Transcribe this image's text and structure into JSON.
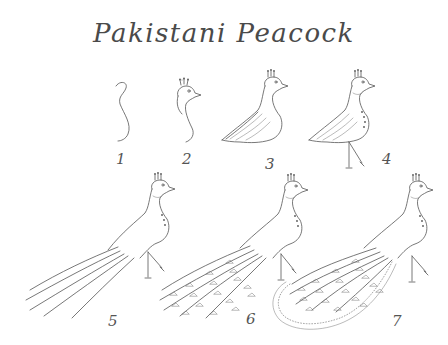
{
  "title": "Pakistani Peacock",
  "steps": [
    {
      "number": "1",
      "description": "Neck curve"
    },
    {
      "number": "2",
      "description": "Head with crest and beak"
    },
    {
      "number": "3",
      "description": "Body and folded wing"
    },
    {
      "number": "4",
      "description": "Legs and neck markings"
    },
    {
      "number": "5",
      "description": "Long train feathers"
    },
    {
      "number": "6",
      "description": "Eye spots on train"
    },
    {
      "number": "7",
      "description": "Fringed train outline"
    }
  ],
  "colors": {
    "background": "#ffffff",
    "ink": "#555555"
  }
}
